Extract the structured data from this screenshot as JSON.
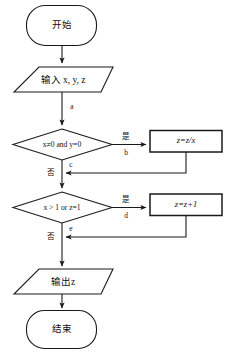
{
  "diagram": {
    "language": "zh",
    "colors": {
      "stroke": "#1a1a1a",
      "fill": "#ffffff",
      "text": "#111111",
      "background": "#ffffff"
    },
    "nodes": {
      "start": {
        "label": "开始",
        "shape": "terminator"
      },
      "input": {
        "label": "输入 x, y, z",
        "shape": "parallelogram"
      },
      "decision1": {
        "label": "x≠0 and y=0",
        "shape": "diamond"
      },
      "process1": {
        "label": "z=z/x",
        "shape": "rectangle"
      },
      "decision2": {
        "label": "x > 1 or z=1",
        "shape": "diamond"
      },
      "process2": {
        "label": "z=z+1",
        "shape": "rectangle"
      },
      "output": {
        "label": "输出z",
        "shape": "parallelogram"
      },
      "end": {
        "label": "结束",
        "shape": "terminator"
      }
    },
    "edge_labels": {
      "a": "a",
      "b": "b",
      "c": "c",
      "d": "d",
      "e": "e",
      "yes1": "是",
      "no1": "否",
      "yes2": "是",
      "no2": "否"
    }
  }
}
